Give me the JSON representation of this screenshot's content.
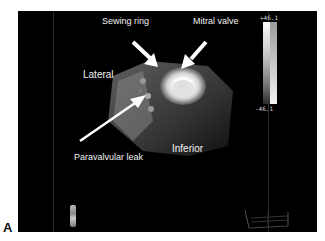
{
  "figure": {
    "panel_letter": "A"
  },
  "viewer": {
    "annotations": {
      "sewing_ring": "Sewing ring",
      "mitral_valve": "Mitral valve",
      "lateral": "Lateral",
      "inferior": "Inferior",
      "paravalvular_leak": "Paravalvular leak"
    },
    "colorbar": {
      "max_label": "+46.1",
      "min_label": "-46.1"
    }
  }
}
